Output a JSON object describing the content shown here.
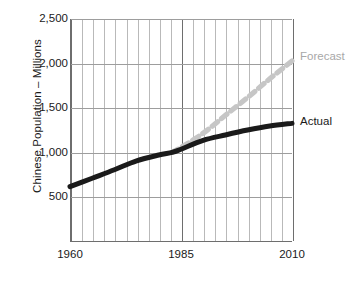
{
  "chart_data": {
    "type": "line",
    "title": "",
    "xlabel": "",
    "ylabel": "Chinese Population – Millions",
    "xlim": [
      1960,
      2010
    ],
    "ylim": [
      0,
      2500
    ],
    "grid": true,
    "y_ticks": [
      "500",
      "1,000",
      "1,500",
      "2,000",
      "2,500"
    ],
    "y_tick_values": [
      500,
      1000,
      1500,
      2000,
      2500
    ],
    "x_ticks": [
      "1960",
      "1985",
      "2010"
    ],
    "x_tick_values": [
      1960,
      1985,
      2010
    ],
    "x_gridline_values": [
      1960,
      1965,
      1970,
      1975,
      1980,
      1985,
      1990,
      1995,
      2000,
      2005,
      2010
    ],
    "legend_position": "right-inline",
    "series": [
      {
        "name": "Actual",
        "style": "solid",
        "color": "#1a1a1a",
        "x": [
          1960,
          1965,
          1970,
          1975,
          1980,
          1983,
          1985,
          1990,
          1995,
          2000,
          2005,
          2010
        ],
        "values": [
          620,
          715,
          810,
          910,
          975,
          1005,
          1040,
          1140,
          1200,
          1255,
          1300,
          1330
        ]
      },
      {
        "name": "Forecast",
        "style": "dashed",
        "color": "#c6c6c6",
        "x": [
          1983,
          1985,
          1990,
          1995,
          2000,
          2005,
          2010
        ],
        "values": [
          1005,
          1060,
          1220,
          1420,
          1620,
          1830,
          2030
        ]
      }
    ],
    "annotations": [
      {
        "name": "Forecast",
        "color": "#a8a8a8"
      },
      {
        "name": "Actual",
        "color": "#1a1a1a"
      }
    ]
  }
}
